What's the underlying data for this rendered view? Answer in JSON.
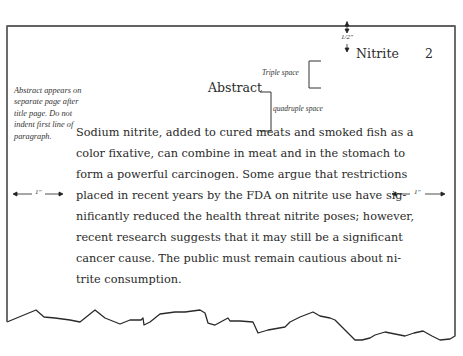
{
  "page": {
    "running_head": "Nitrite    2",
    "running_head_word": "Nitrite",
    "page_number": "2",
    "top_margin_label": "1/2\"",
    "abstract_title": "Abstract",
    "annotations": {
      "triple_space": "Triple space",
      "quadruple_space": "quadruple space",
      "side_note": "Abstract appears on separate page after title page. Do not indent first line of paragraph.",
      "left_margin": "1\"",
      "right_margin": "1\""
    },
    "body_lines": [
      "Sodium nitrite, added to cured meats and smoked fish as a",
      "color fixative, can combine in meat and in the stomach to",
      "form a powerful carcinogen. Some argue that restrictions",
      "placed in recent years by the FDA on nitrite use have sig-",
      "nificantly reduced the health threat nitrite poses; however,",
      "recent research suggests that it may still be a significant",
      "cancer cause. The public must remain cautious about ni-",
      "trite consumption."
    ]
  },
  "colors": {
    "frame_stroke": "#555555",
    "torn_edge": "#2a2a2a",
    "text": "#2a2a2a"
  }
}
